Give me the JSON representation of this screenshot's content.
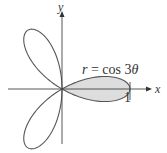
{
  "figure": {
    "equation_label": "r = cos 3θ",
    "equation_r": "r",
    "equation_rest": " = cos 3",
    "equation_theta": "θ",
    "x_axis_label": "x",
    "y_axis_label": "y",
    "tick_label": "1",
    "colors": {
      "curve": "#555555",
      "axes": "#444444",
      "shaded_fill": "#dddddd"
    }
  },
  "chart_data": {
    "type": "polar",
    "title": "",
    "equation": "r = cos 3θ",
    "curve": "three-petaled rose",
    "petals": 3,
    "petal_directions_deg": [
      0,
      120,
      240
    ],
    "max_r": 1,
    "shaded_region": "half of right petal, θ from 0 to π/6 and -π/6 to 0 (the right petal)",
    "xlabel": "x",
    "ylabel": "y",
    "ticks": [
      {
        "axis": "x",
        "value": 1,
        "label": "1"
      }
    ]
  }
}
